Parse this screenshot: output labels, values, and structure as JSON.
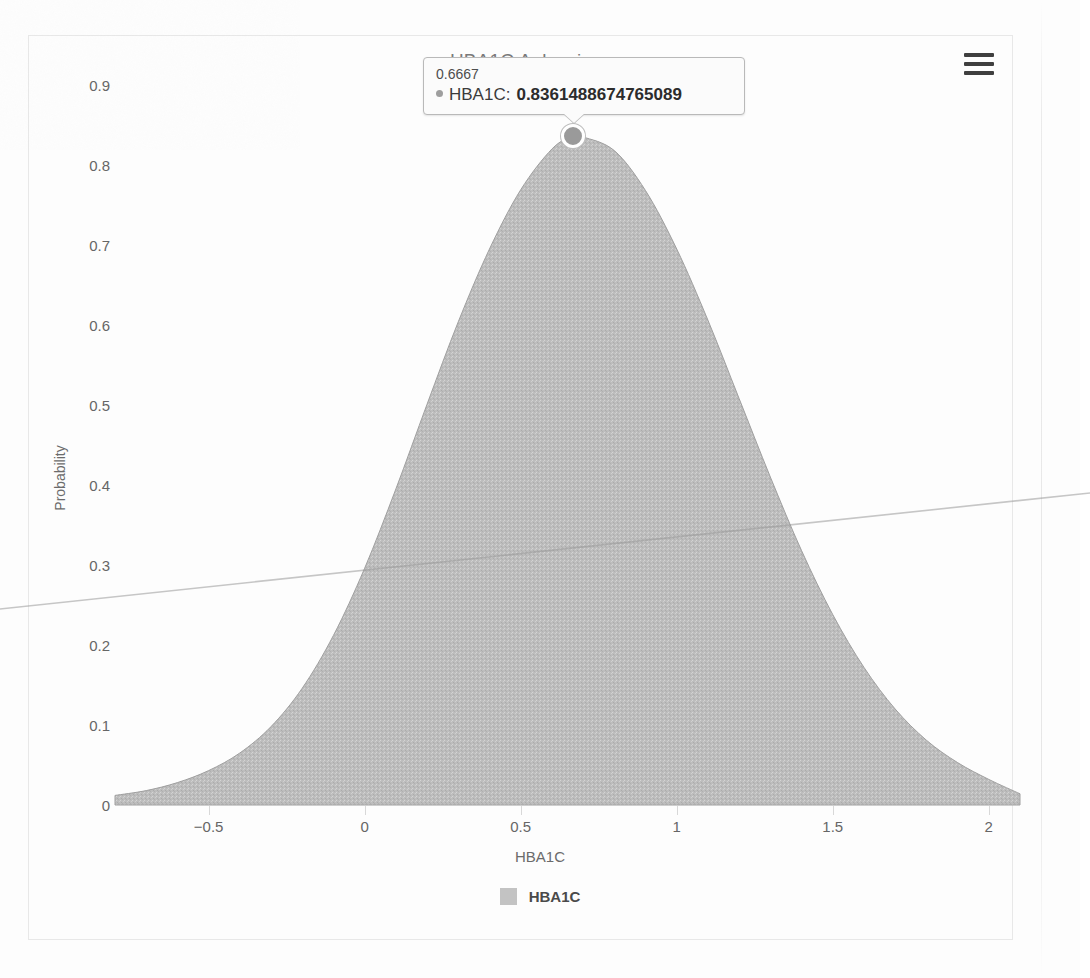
{
  "chart_data": {
    "type": "area",
    "title": "HBA1C Anlaysis",
    "xlabel": "HBA1C",
    "ylabel": "Probability",
    "xlim": [
      -0.8,
      2.1
    ],
    "ylim": [
      0,
      0.95
    ],
    "grid": false,
    "legend_position": "bottom",
    "series": [
      {
        "name": "HBA1C",
        "color": "#b9b9b9",
        "x": [
          -0.8,
          -0.7,
          -0.6,
          -0.5,
          -0.4,
          -0.3,
          -0.2,
          -0.1,
          0.0,
          0.1,
          0.2,
          0.3,
          0.4,
          0.5,
          0.6,
          0.6667,
          0.7,
          0.8,
          0.9,
          1.0,
          1.1,
          1.2,
          1.3,
          1.4,
          1.5,
          1.6,
          1.7,
          1.8,
          1.9,
          2.0,
          2.1
        ],
        "values": [
          0.012,
          0.018,
          0.028,
          0.043,
          0.065,
          0.098,
          0.146,
          0.212,
          0.296,
          0.395,
          0.501,
          0.604,
          0.695,
          0.769,
          0.82,
          0.8361488674765089,
          0.835,
          0.818,
          0.768,
          0.695,
          0.606,
          0.508,
          0.41,
          0.318,
          0.238,
          0.172,
          0.12,
          0.081,
          0.053,
          0.032,
          0.014
        ]
      }
    ],
    "x_ticks": [
      "-0.5",
      "0",
      "0.5",
      "1",
      "1.5",
      "2"
    ],
    "x_tick_values": [
      -0.5,
      0,
      0.5,
      1,
      1.5,
      2
    ],
    "y_ticks": [
      "0",
      "0.1",
      "0.2",
      "0.3",
      "0.4",
      "0.5",
      "0.6",
      "0.7",
      "0.8",
      "0.9"
    ],
    "y_tick_values": [
      0,
      0.1,
      0.2,
      0.3,
      0.4,
      0.5,
      0.6,
      0.7,
      0.8,
      0.9
    ]
  },
  "header": {
    "title": "HBA1C Anlaysis",
    "menu_icon": "hamburger-menu-icon"
  },
  "axes": {
    "y_title": "Probability",
    "x_title": "HBA1C"
  },
  "legend": {
    "items": [
      {
        "label": "HBA1C",
        "color": "#b9b9b9"
      }
    ]
  },
  "tooltip": {
    "visible": true,
    "header": "0.6667",
    "series_name": "HBA1C:",
    "value": "0.8361488674765089",
    "point_x": 0.6667,
    "point_y": 0.8361488674765089
  },
  "colors": {
    "series_fill": "#b9b9b9",
    "axis_text": "#666666",
    "card_border": "#e8e8e8",
    "tooltip_border": "#b9b9b9",
    "menu_icon": "#3f3f3f"
  }
}
